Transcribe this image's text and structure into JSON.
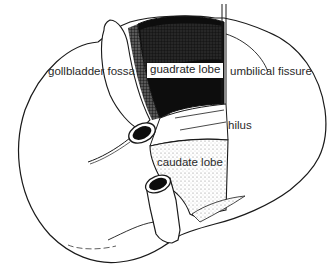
{
  "figure": {
    "caption_fragment": "",
    "labels": {
      "gallbladder_fossa": "gollbladder fossa",
      "quadrate_lobe": "guadrate lobe",
      "umbilical_fissure": "umbilical fissure",
      "hilus": "hilus",
      "caudate_lobe": "caudate lobe"
    },
    "colors": {
      "background": "#ffffff",
      "outline": "#1a1a1a",
      "quadrate_fill": "#0d0d0d",
      "stipple": "#9a9a9a",
      "label_text": "#2a2a2a"
    }
  }
}
